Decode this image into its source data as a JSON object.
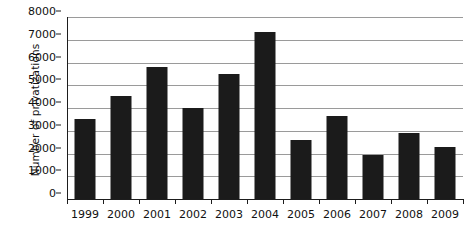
{
  "chart_data": {
    "type": "bar",
    "title": "",
    "xlabel": "",
    "ylabel": "Number of privatizations",
    "categories": [
      "1999",
      "2000",
      "2001",
      "2002",
      "2003",
      "2004",
      "2005",
      "2006",
      "2007",
      "2008",
      "2009"
    ],
    "values": [
      3500,
      4550,
      5800,
      4000,
      5500,
      7350,
      2600,
      3650,
      1950,
      2900,
      2300
    ],
    "ylim": [
      0,
      8000
    ],
    "ytick_labels": [
      "0",
      "1000",
      "2000",
      "3000",
      "4000",
      "5000",
      "6000",
      "7000",
      "8000"
    ],
    "ytick_values": [
      0,
      1000,
      2000,
      3000,
      4000,
      5000,
      6000,
      7000,
      8000
    ],
    "grid": true,
    "grid_axis": "y",
    "legend": null,
    "legend_position": "none",
    "bar_color": "#1b1b1b",
    "grid_color": "#9a9a9a",
    "axis_color": "#1d1d1d",
    "background_color": "#ffffff"
  }
}
